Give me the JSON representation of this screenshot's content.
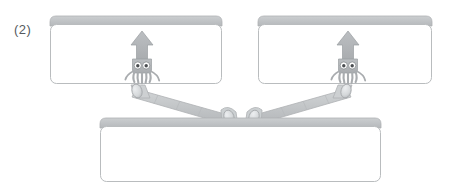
{
  "figure": {
    "label": "(2)",
    "caption": "",
    "type": "mechanical-linkage-diagram",
    "width": 455,
    "height": 195,
    "background_color": "#ffffff"
  },
  "colors": {
    "panel_face": "#ffffff",
    "panel_border": "#b9bcbe",
    "panel_bevel": "#c2c5c7",
    "panel_bevel_dark": "#aeb1b4",
    "arm_fill": "#c6c9cb",
    "arm_edge": "#b1b4b7",
    "joint_fill": "#d9dcde",
    "joint_edge": "#b0b3b6",
    "squid_body": "#b3b6b9",
    "squid_outline": "#9a9da0",
    "squid_eye_white": "#ffffff",
    "squid_pupil": "#4a4d50",
    "label_text": "#555a5e"
  },
  "panels": [
    {
      "id": "upper-left-panel",
      "name": "Upper left panel",
      "x": 50,
      "y": 16,
      "width": 172,
      "height": 68,
      "content_icon": "squid-icon",
      "content_label": ""
    },
    {
      "id": "upper-right-panel",
      "name": "Upper right panel",
      "x": 258,
      "y": 16,
      "width": 174,
      "height": 68,
      "content_icon": "squid-icon",
      "content_label": ""
    },
    {
      "id": "lower-base-panel",
      "name": "Lower base panel",
      "x": 100,
      "y": 118,
      "width": 281,
      "height": 64,
      "content_icon": "",
      "content_label": ""
    }
  ],
  "arms": [
    {
      "id": "left-arm",
      "name": "Left connecting arm",
      "from_joint": "left-upper-joint",
      "to_joint": "left-center-joint"
    },
    {
      "id": "right-arm",
      "name": "Right connecting arm",
      "from_joint": "right-upper-joint",
      "to_joint": "right-center-joint"
    }
  ],
  "joints": [
    {
      "id": "left-upper-joint",
      "name": "Left upper hinge",
      "cx": 139,
      "cy": 92
    },
    {
      "id": "left-center-joint",
      "name": "Left center hinge",
      "cx": 228,
      "cy": 118
    },
    {
      "id": "right-center-joint",
      "name": "Right center hinge",
      "cx": 254,
      "cy": 118
    },
    {
      "id": "right-upper-joint",
      "name": "Right upper hinge",
      "cx": 344,
      "cy": 92
    }
  ],
  "icons": {
    "squid": {
      "name": "squid-icon",
      "description": "stylized squid with triangular mantle, two round eyes and tentacles",
      "left_position": {
        "cx": 142,
        "cy": 52
      },
      "right_position": {
        "cx": 348,
        "cy": 52
      }
    }
  }
}
